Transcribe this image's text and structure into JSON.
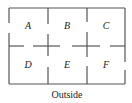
{
  "diagram": {
    "type": "floor-plan",
    "rooms": [
      {
        "label": "A",
        "x": 28,
        "y": 29
      },
      {
        "label": "B",
        "x": 67,
        "y": 29
      },
      {
        "label": "C",
        "x": 106,
        "y": 29
      },
      {
        "label": "D",
        "x": 28,
        "y": 68
      },
      {
        "label": "E",
        "x": 67,
        "y": 68
      },
      {
        "label": "F",
        "x": 106,
        "y": 68
      }
    ],
    "outside_label": "Outside",
    "colors": {
      "wall": "#555555",
      "text": "#222222",
      "background": "#ffffff"
    }
  }
}
